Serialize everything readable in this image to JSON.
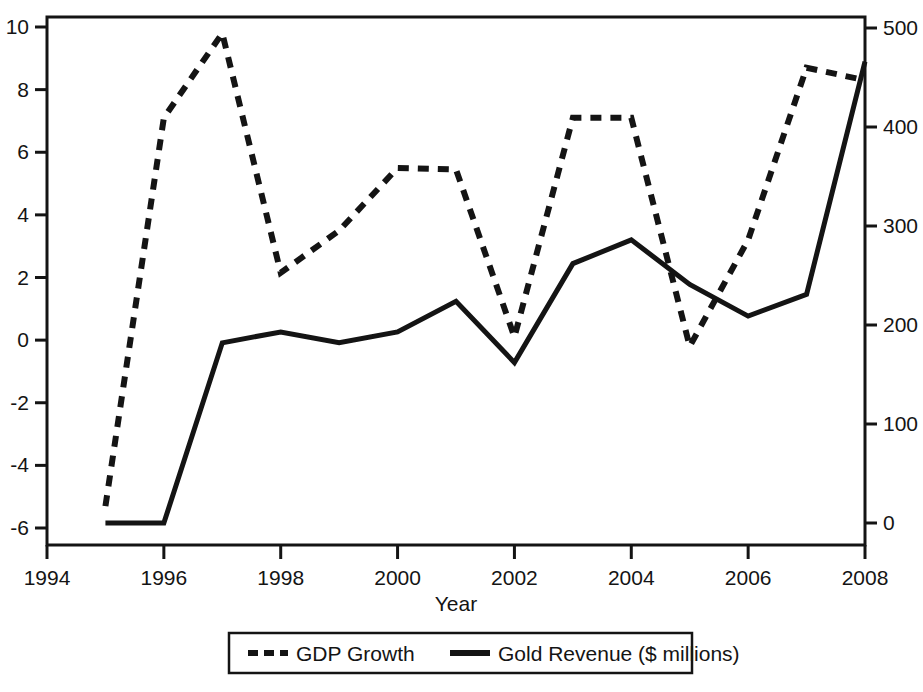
{
  "chart_data": {
    "type": "line",
    "title": "",
    "xlabel": "Year",
    "ylabel": "",
    "y2label": "",
    "grid": false,
    "legend_position": "bottom",
    "x": [
      1995,
      1996,
      1997,
      1998,
      1999,
      2000,
      2001,
      2002,
      2003,
      2004,
      2005,
      2006,
      2007,
      2008
    ],
    "xlim": [
      1994,
      2008
    ],
    "xticks": [
      "1994",
      "1996",
      "1998",
      "2000",
      "2002",
      "2004",
      "2006",
      "2008"
    ],
    "xtick_values": [
      1994,
      1996,
      1998,
      2000,
      2002,
      2004,
      2006,
      2008
    ],
    "ylim": [
      -6.0,
      10.0
    ],
    "yticks": [
      "10",
      "8",
      "6",
      "4",
      "2",
      "0",
      "-2",
      "-4",
      "-6"
    ],
    "ytick_values": [
      10,
      8,
      6,
      4,
      2,
      0,
      -2,
      -4,
      -6
    ],
    "y2lim": [
      0,
      500
    ],
    "y2ticks": [
      "500",
      "400",
      "300",
      "200",
      "100",
      "0"
    ],
    "y2tick_values": [
      500,
      400,
      300,
      200,
      100,
      0
    ],
    "series": [
      {
        "name": "GDP Growth",
        "axis": "left",
        "style": "dashed",
        "color": "#141414",
        "values": [
          -5.3,
          7.1,
          9.8,
          2.15,
          3.5,
          5.5,
          5.45,
          0.1,
          7.1,
          7.1,
          -0.2,
          3.2,
          8.7,
          8.3
        ]
      },
      {
        "name": "Gold Revenue ($ millions)",
        "axis": "right",
        "style": "solid",
        "color": "#141414",
        "values": [
          0,
          0,
          182,
          193,
          182,
          193,
          224,
          162,
          262,
          286,
          241,
          209,
          231,
          466
        ]
      }
    ],
    "legend": [
      {
        "label": "GDP Growth",
        "style": "dashed"
      },
      {
        "label": "Gold Revenue ($ millions)",
        "style": "solid"
      }
    ]
  }
}
